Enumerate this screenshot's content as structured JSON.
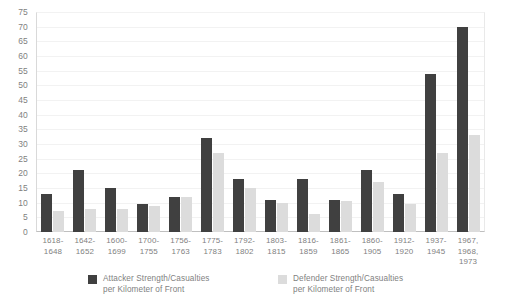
{
  "chart_data": {
    "type": "bar",
    "title": "",
    "subtitle": "",
    "xlabel": "",
    "ylabel": "",
    "ylim": [
      0,
      75
    ],
    "ytick_step": 5,
    "yticks": [
      "75",
      "70",
      "65",
      "60",
      "55",
      "50",
      "45",
      "40",
      "35",
      "30",
      "25",
      "20",
      "15",
      "10",
      "5",
      "0"
    ],
    "grid": true,
    "legend_position": "bottom",
    "categories": [
      "1618-\n1648",
      "1642-\n1652",
      "1600-\n1699",
      "1700-\n1755",
      "1756-\n1763",
      "1775-\n1783",
      "1792-\n1802",
      "1803-\n1815",
      "1816-\n1859",
      "1861-\n1865",
      "1860-\n1905",
      "1912-\n1920",
      "1937-\n1945",
      "1967,\n1968,\n1973"
    ],
    "series": [
      {
        "name": "Attacker Strength/Casualties\nper Kilometer of Front",
        "color": "#404040",
        "values": [
          13,
          21,
          15,
          9.5,
          12,
          32,
          18,
          11,
          18,
          11,
          21,
          13,
          54,
          70
        ]
      },
      {
        "name": "Defender Strength/Casualties\nper Kilometer of Front",
        "color": "#dcdcdc",
        "values": [
          7,
          8,
          8,
          9,
          12,
          27,
          15,
          10,
          6,
          10.5,
          17,
          9.5,
          27,
          33
        ]
      }
    ]
  },
  "legend": {
    "attacker_label": "Attacker Strength/Casualties\nper Kilometer of Front",
    "defender_label": "Defender Strength/Casualties\nper Kilometer of Front"
  }
}
